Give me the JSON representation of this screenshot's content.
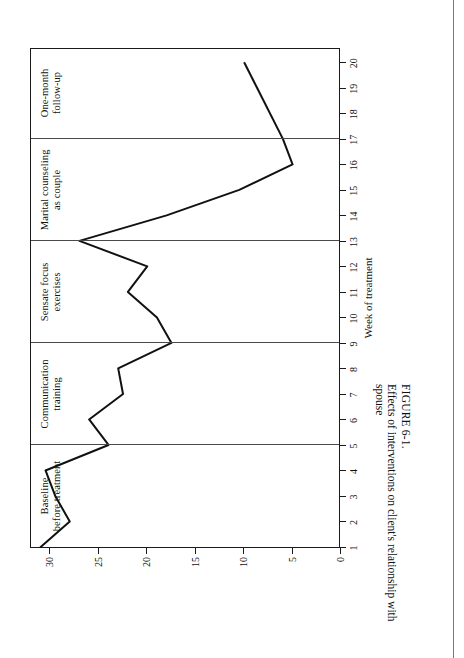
{
  "figure": {
    "caption_number": "FIGURE 6-1.",
    "caption_text": "Effects of interventions on client's relationship with spouse"
  },
  "chart_data": {
    "type": "line",
    "title": "",
    "xlabel": "Week of treatment",
    "ylabel": "Number of arguments or disagreements",
    "xlim": [
      1,
      20
    ],
    "ylim": [
      0,
      32
    ],
    "grid": false,
    "legend": "none",
    "orientation": "rotated-90-on-page",
    "xticks": [
      1,
      2,
      3,
      4,
      5,
      6,
      7,
      8,
      9,
      10,
      11,
      12,
      13,
      14,
      15,
      16,
      17,
      18,
      19,
      20
    ],
    "yticks": [
      0,
      5,
      10,
      15,
      20,
      25,
      30
    ],
    "x": [
      1,
      2,
      3,
      4,
      5,
      6,
      7,
      8,
      9,
      10,
      11,
      12,
      13,
      14,
      15,
      16,
      17,
      18,
      19,
      20
    ],
    "values": [
      31,
      28,
      29.5,
      30.5,
      24,
      26,
      22.5,
      23,
      17.5,
      19,
      22,
      20,
      27,
      18,
      10.5,
      5,
      6,
      null,
      null,
      10
    ],
    "series": [
      {
        "name": "Number of arguments or disagreements",
        "color": "#111111",
        "values": [
          31,
          28,
          29.5,
          30.5,
          24,
          26,
          22.5,
          23,
          17.5,
          19,
          22,
          20,
          27,
          18,
          10.5,
          5,
          6,
          null,
          null,
          10
        ]
      }
    ],
    "phases": [
      {
        "label": "Baseline\nbefore treatment",
        "start": 1,
        "end": 5
      },
      {
        "label": "Communication\ntraining",
        "start": 5,
        "end": 9
      },
      {
        "label": "Sensate focus\nexercises",
        "start": 9,
        "end": 13
      },
      {
        "label": "Marital counseling\nas couple",
        "start": 13,
        "end": 17
      },
      {
        "label": "One-month\nfollow-up",
        "start": 17,
        "end": 20.6
      }
    ],
    "phase_dividers": [
      5,
      9,
      13,
      17
    ]
  }
}
